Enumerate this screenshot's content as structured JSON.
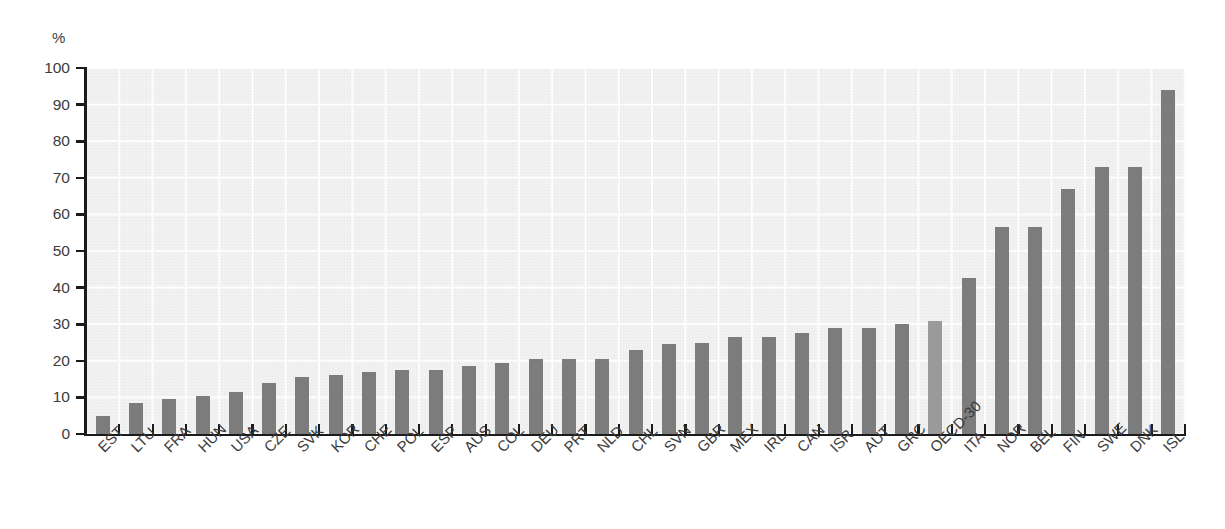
{
  "chart_data": {
    "type": "bar",
    "title": "",
    "subtitle": "",
    "xlabel": "",
    "ylabel": "",
    "yunit": "%",
    "ylim": [
      0,
      100
    ],
    "ytick_step": 10,
    "yticks": [
      0,
      10,
      20,
      30,
      40,
      50,
      60,
      70,
      80,
      90,
      100
    ],
    "grid": true,
    "legend": "none",
    "bar_color": "#7c7c7c",
    "highlight_color": "#9a9a9a",
    "highlight_category": "OECD-30",
    "categories": [
      "EST",
      "LTU",
      "FRA",
      "HUN",
      "USA",
      "CZE",
      "SVK",
      "KOR",
      "CHE",
      "POL",
      "ESP",
      "AUS",
      "COL",
      "DEU",
      "PRT",
      "NLD",
      "CHL",
      "SVN",
      "GBR",
      "MEX",
      "IRL",
      "CAN",
      "ISR",
      "AUT",
      "GRC",
      "OECD-30",
      "ITA",
      "NOR",
      "BEL",
      "FIN",
      "SWE",
      "DNK",
      "ISL"
    ],
    "values": [
      5,
      8.5,
      9.5,
      10.5,
      11.5,
      14,
      15.5,
      16,
      17,
      17.5,
      17.5,
      18.5,
      19.5,
      20.5,
      20.5,
      20.5,
      23,
      24.5,
      25,
      26.5,
      26.5,
      27.5,
      29,
      29,
      30,
      31,
      42.5,
      56.5,
      56.5,
      67,
      73,
      73,
      94
    ]
  }
}
